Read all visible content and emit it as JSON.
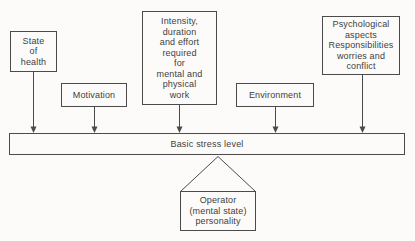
{
  "diagram": {
    "boxes": {
      "state_of_health": {
        "label": "State\nof\nhealth"
      },
      "motivation": {
        "label": "Motivation"
      },
      "intensity": {
        "label": "Intensity,\nduration\nand effort\nrequired\nfor\nmental and\nphysical\nwork"
      },
      "environment": {
        "label": "Environment"
      },
      "psychological": {
        "label": "Psychological\naspects\nResponsibilities\nworries and\nconflict"
      }
    },
    "bar": {
      "label": "Basic stress level"
    },
    "operator": {
      "label": "Operator\n(mental state)\npersonality"
    },
    "colors": {
      "line": "#4b4b4b",
      "text": "#3e3e3e",
      "background": "#fcfbf9"
    }
  }
}
